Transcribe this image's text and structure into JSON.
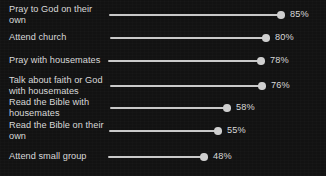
{
  "chart_data": {
    "type": "bar",
    "subtype": "lollipop",
    "title": "",
    "subtitle": "",
    "xlabel": "",
    "ylabel": "",
    "xlim": [
      0,
      100
    ],
    "grid": false,
    "legend": null,
    "orientation": "horizontal",
    "value_suffix": "%",
    "categories": [
      "Pray to God on their own",
      "Attend church",
      "Pray with housemates",
      "Talk about faith or God with housemates",
      "Read the Bible with housemates",
      "Read the Bible on their own",
      "Attend small group"
    ],
    "values": [
      85,
      80,
      78,
      76,
      58,
      55,
      48
    ],
    "value_labels": [
      "85%",
      "80%",
      "78%",
      "76%",
      "58%",
      "55%",
      "48%"
    ]
  },
  "style": {
    "background_color": "#121212",
    "text_color": "#d9d9d9",
    "line_color": "#c9c9c9",
    "marker_color": "#cfcfcf"
  },
  "rows": [
    {
      "label": "Pray to God on their own",
      "value_label": "85%",
      "lines": 2,
      "y": 15,
      "stem_start": 109,
      "dot_x": 281,
      "label_x": 290
    },
    {
      "label": "Attend church",
      "value_label": "80%",
      "lines": 1,
      "y": 38,
      "stem_start": 110,
      "dot_x": 266,
      "label_x": 275
    },
    {
      "label": "Pray with housemates",
      "value_label": "78%",
      "lines": 1,
      "y": 61,
      "stem_start": 108,
      "dot_x": 261,
      "label_x": 270
    },
    {
      "label": "Talk about faith or God with housemates",
      "value_label": "76%",
      "lines": 2,
      "y": 86,
      "stem_start": 110,
      "dot_x": 262,
      "label_x": 271
    },
    {
      "label": "Read the Bible with housemates",
      "value_label": "58%",
      "lines": 2,
      "y": 108,
      "stem_start": 110,
      "dot_x": 227,
      "label_x": 236
    },
    {
      "label": "Read the Bible on their own",
      "value_label": "55%",
      "lines": 2,
      "y": 131,
      "stem_start": 109,
      "dot_x": 218,
      "label_x": 227
    },
    {
      "label": "Attend small group",
      "value_label": "48%",
      "lines": 1,
      "y": 157,
      "stem_start": 108,
      "dot_x": 204,
      "label_x": 213
    }
  ]
}
